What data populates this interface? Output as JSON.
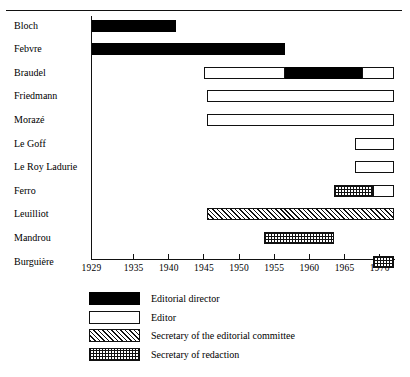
{
  "chart_data": {
    "type": "bar",
    "title": "",
    "xlabel": "",
    "ylabel": "",
    "xlim": [
      1929,
      1972
    ],
    "grid": false,
    "legend_position": "bottom",
    "tick_labels": [
      "1929",
      "1935",
      "1940",
      "1945",
      "1950",
      "1955",
      "1960",
      "1965",
      "1970"
    ],
    "tick_values": [
      1929,
      1935,
      1940,
      1945,
      1950,
      1955,
      1960,
      1965,
      1970
    ],
    "categories": [
      "Bloch",
      "Febvre",
      "Braudel",
      "Friedmann",
      "Morazé",
      "Le Goff",
      "Le Roy Ladurie",
      "Ferro",
      "Leuilliot",
      "Mandrou",
      "Burguière"
    ],
    "series": [
      {
        "name": "Editorial director",
        "key": "editorial-director",
        "color": "#000000",
        "pattern": "solid-black"
      },
      {
        "name": "Editor",
        "key": "editor",
        "color": "#ffffff",
        "pattern": "open-white"
      },
      {
        "name": "Secretary of the editorial committee",
        "key": "secretary-editorial-committee",
        "color": "#ffffff",
        "pattern": "diagonal-hatch"
      },
      {
        "name": "Secretary of redaction",
        "key": "secretary-redaction",
        "color": "#ffffff",
        "pattern": "checkerboard"
      }
    ],
    "rows": [
      {
        "name": "Bloch",
        "segments": [
          {
            "role": "Editorial director",
            "start": 1929,
            "end": 1941
          }
        ]
      },
      {
        "name": "Febvre",
        "segments": [
          {
            "role": "Editorial director",
            "start": 1929,
            "end": 1956.5
          }
        ]
      },
      {
        "name": "Braudel",
        "segments": [
          {
            "role": "Editor",
            "start": 1945,
            "end": 1956.5
          },
          {
            "role": "Editorial director",
            "start": 1956.5,
            "end": 1967.5
          },
          {
            "role": "Editor",
            "start": 1967.5,
            "end": 1972
          }
        ]
      },
      {
        "name": "Friedmann",
        "segments": [
          {
            "role": "Editor",
            "start": 1945.5,
            "end": 1972
          }
        ]
      },
      {
        "name": "Morazé",
        "segments": [
          {
            "role": "Editor",
            "start": 1945.5,
            "end": 1972
          }
        ]
      },
      {
        "name": "Le Goff",
        "segments": [
          {
            "role": "Editor",
            "start": 1966.5,
            "end": 1972
          }
        ]
      },
      {
        "name": "Le Roy Ladurie",
        "segments": [
          {
            "role": "Editor",
            "start": 1966.5,
            "end": 1972
          }
        ]
      },
      {
        "name": "Ferro",
        "segments": [
          {
            "role": "Secretary of redaction",
            "start": 1963.5,
            "end": 1969
          },
          {
            "role": "Editor",
            "start": 1969,
            "end": 1972
          }
        ]
      },
      {
        "name": "Leuilliot",
        "segments": [
          {
            "role": "Secretary of the editorial committee",
            "start": 1945.5,
            "end": 1972
          }
        ]
      },
      {
        "name": "Mandrou",
        "segments": [
          {
            "role": "Secretary of redaction",
            "start": 1953.5,
            "end": 1963.5
          }
        ]
      },
      {
        "name": "Burguière",
        "segments": [
          {
            "role": "Secretary of redaction",
            "start": 1969,
            "end": 1972
          }
        ]
      }
    ]
  },
  "legend": {
    "items": [
      {
        "label": "Editorial director",
        "pattern": "solid-black"
      },
      {
        "label": "Editor",
        "pattern": "open-white"
      },
      {
        "label": "Secretary of the editorial committee",
        "pattern": "diagonal-hatch"
      },
      {
        "label": "Secretary of redaction",
        "pattern": "checkerboard"
      }
    ]
  }
}
